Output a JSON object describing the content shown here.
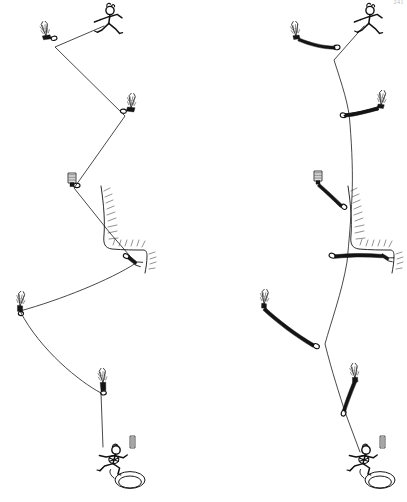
{
  "figure": {
    "title": "Rope drag: zigzag rope path versus extended runners",
    "page_number": "241",
    "background_color": "#ffffff",
    "ink_color": "#151515",
    "panels": [
      {
        "id": "left",
        "name": "zigzag-rope-path",
        "caption": "",
        "description": "Rope clipped short to each piece of protection, forcing a sharp zigzag path and high rope drag.",
        "protection_style": "short-draw",
        "rope_path_type": "zigzag",
        "climber": {
          "name": "lead-climber",
          "x": 104,
          "y": 22
        },
        "belayer": {
          "name": "belayer",
          "x": 116,
          "y": 462
        },
        "rope_vertices": [
          [
            104,
            26
          ],
          [
            55,
            47
          ],
          [
            125,
            116
          ],
          [
            74,
            188
          ],
          [
            110,
            233
          ],
          [
            135,
            263
          ],
          [
            78,
            300
          ],
          [
            18,
            312
          ],
          [
            100,
            393
          ],
          [
            104,
            447
          ],
          [
            112,
            458
          ]
        ],
        "protection": [
          {
            "name": "piton-1",
            "x": 46,
            "y": 36,
            "kind": "piton",
            "sling": "short"
          },
          {
            "name": "piton-2",
            "x": 131,
            "y": 108,
            "kind": "piton",
            "sling": "short"
          },
          {
            "name": "nut-3",
            "x": 72,
            "y": 184,
            "kind": "nut",
            "sling": "short"
          },
          {
            "name": "piton-4-roof",
            "x": 136,
            "y": 262,
            "kind": "piton",
            "sling": "short"
          },
          {
            "name": "piton-5",
            "x": 20,
            "y": 306,
            "kind": "piton",
            "sling": "short"
          },
          {
            "name": "piton-6",
            "x": 103,
            "y": 383,
            "kind": "piton",
            "sling": "short"
          }
        ]
      },
      {
        "id": "right",
        "name": "straight-rope-path",
        "caption": "",
        "description": "Same protection extended with long runners so the rope runs nearly straight, reducing rope drag.",
        "protection_style": "extended-runner",
        "rope_path_type": "straight",
        "climber": {
          "name": "lead-climber",
          "x": 364,
          "y": 22
        },
        "belayer": {
          "name": "belayer",
          "x": 366,
          "y": 462
        },
        "rope_vertices": [
          [
            364,
            26
          ],
          [
            334,
            60
          ],
          [
            350,
            124
          ],
          [
            352,
            196
          ],
          [
            347,
            262
          ],
          [
            325,
            344
          ],
          [
            345,
            412
          ],
          [
            360,
            450
          ],
          [
            365,
            459
          ]
        ],
        "protection": [
          {
            "name": "piton-1",
            "x": 296,
            "y": 36,
            "kind": "piton",
            "sling": "long"
          },
          {
            "name": "piton-2",
            "x": 381,
            "y": 105,
            "kind": "piton",
            "sling": "long"
          },
          {
            "name": "nut-3",
            "x": 318,
            "y": 182,
            "kind": "nut",
            "sling": "long"
          },
          {
            "name": "piton-4-roof",
            "x": 388,
            "y": 258,
            "kind": "piton",
            "sling": "long"
          },
          {
            "name": "piton-5",
            "x": 264,
            "y": 304,
            "kind": "piton",
            "sling": "long"
          },
          {
            "name": "piton-6",
            "x": 355,
            "y": 378,
            "kind": "piton",
            "sling": "long"
          }
        ]
      }
    ],
    "rock_features": [
      {
        "name": "roof-overhang-left",
        "panel": "left",
        "x": 100,
        "y": 185,
        "width": 46,
        "height": 95
      },
      {
        "name": "roof-overhang-right",
        "panel": "right",
        "x": 345,
        "y": 185,
        "width": 48,
        "height": 95
      }
    ]
  }
}
